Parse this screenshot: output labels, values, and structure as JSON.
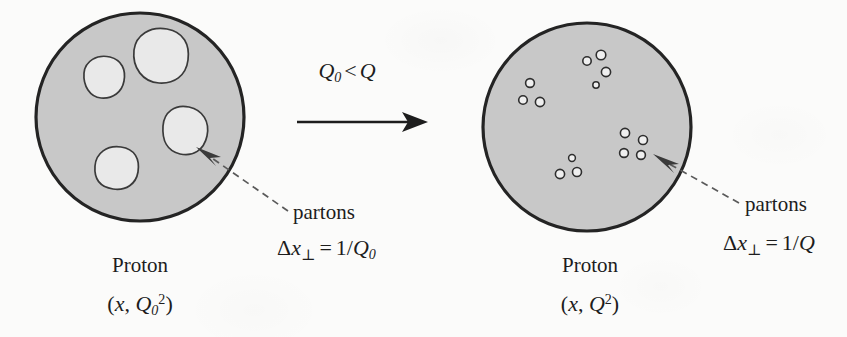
{
  "figure": {
    "background_color": "#fbfbfa",
    "ink_color": "#1d1d1d",
    "proton_fill_color": "#c8c8c8",
    "parton_fill_color": "#e9e9e9"
  },
  "center": {
    "condition_label": "Q₀ < Q",
    "condition_parts": {
      "q_symbol": "Q",
      "subscript_zero": "0",
      "relation": "<",
      "q_symbol_2": "Q"
    },
    "arrow_name": "evolution-arrow"
  },
  "left_panel": {
    "proton_label": "Proton",
    "state_label": "(x, Q₀²)",
    "state_parts": {
      "open_paren": "(",
      "x_symbol": "x",
      "comma": ", ",
      "q_symbol": "Q",
      "subscript": "0",
      "superscript": "2",
      "close_paren": ")"
    },
    "callout_label": "partons",
    "resolution_label": "Δx⊥ = 1/Q₀",
    "resolution_parts": {
      "delta": "Δ",
      "x_symbol": "x",
      "perp": "⊥",
      "equals": "=",
      "one_over": "1/",
      "q_symbol": "Q",
      "subscript": "0"
    },
    "parton_count": 4,
    "partons": [
      {
        "cx": 103,
        "cy": 78,
        "r": 21,
        "seed": 1
      },
      {
        "cx": 161,
        "cy": 55,
        "r": 27,
        "seed": 2
      },
      {
        "cx": 186,
        "cy": 133,
        "r": 24,
        "seed": 3
      },
      {
        "cx": 116,
        "cy": 168,
        "r": 22,
        "seed": 4
      }
    ],
    "circle": {
      "cx": 140,
      "cy": 117,
      "r": 105
    }
  },
  "right_panel": {
    "proton_label": "Proton",
    "state_label": "(x, Q²)",
    "state_parts": {
      "open_paren": "(",
      "x_symbol": "x",
      "comma": ", ",
      "q_symbol": "Q",
      "superscript": "2",
      "close_paren": ")"
    },
    "callout_label": "partons",
    "resolution_label": "Δx⊥ = 1/Q",
    "resolution_parts": {
      "delta": "Δ",
      "x_symbol": "x",
      "perp": "⊥",
      "equals": "=",
      "one_over": "1/",
      "q_symbol": "Q"
    },
    "cluster_count": 4,
    "parton_dots": [
      {
        "cx": 587,
        "cy": 61,
        "r": 4.2
      },
      {
        "cx": 601,
        "cy": 55,
        "r": 4.8
      },
      {
        "cx": 606,
        "cy": 72,
        "r": 4.6
      },
      {
        "cx": 596,
        "cy": 85,
        "r": 3.2
      },
      {
        "cx": 530,
        "cy": 83,
        "r": 4.4
      },
      {
        "cx": 523,
        "cy": 100,
        "r": 4.3
      },
      {
        "cx": 540,
        "cy": 102,
        "r": 4.6
      },
      {
        "cx": 625,
        "cy": 133,
        "r": 4.6
      },
      {
        "cx": 643,
        "cy": 140,
        "r": 4.5
      },
      {
        "cx": 624,
        "cy": 153,
        "r": 4.4
      },
      {
        "cx": 641,
        "cy": 155,
        "r": 4.4
      },
      {
        "cx": 572,
        "cy": 158,
        "r": 3.4
      },
      {
        "cx": 560,
        "cy": 174,
        "r": 4.6
      },
      {
        "cx": 577,
        "cy": 172,
        "r": 4.5
      }
    ],
    "circle": {
      "cx": 587,
      "cy": 127,
      "r": 105
    }
  }
}
